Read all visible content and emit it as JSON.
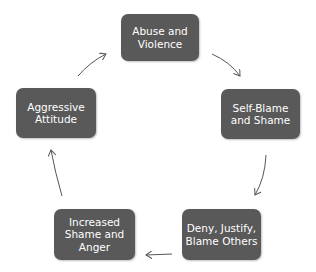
{
  "diagram": {
    "type": "cycle",
    "node_color": "#595959",
    "text_color": "#ffffff",
    "arrow_color": "#555555",
    "nodes": [
      {
        "id": "abuse",
        "label": "Abuse and\nViolence"
      },
      {
        "id": "self-blame",
        "label": "Self-Blame\nand Shame"
      },
      {
        "id": "deny",
        "label": "Deny, Justify,\nBlame Others"
      },
      {
        "id": "increased",
        "label": "Increased\nShame and\nAnger"
      },
      {
        "id": "aggressive",
        "label": "Aggressive\nAttitude"
      }
    ],
    "edges": [
      {
        "from": "abuse",
        "to": "self-blame"
      },
      {
        "from": "self-blame",
        "to": "deny"
      },
      {
        "from": "deny",
        "to": "increased"
      },
      {
        "from": "increased",
        "to": "aggressive"
      },
      {
        "from": "aggressive",
        "to": "abuse"
      }
    ]
  }
}
